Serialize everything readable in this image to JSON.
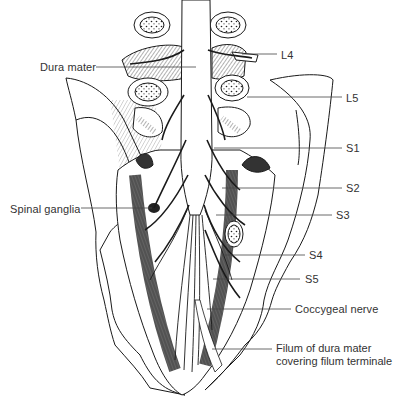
{
  "figure": {
    "line_color": "#1a1a1a",
    "leader_color": "#444444",
    "text_color": "#333333",
    "background": "#ffffff"
  },
  "labels": [
    {
      "id": "dura-mater",
      "text": "Dura mater",
      "x": 40,
      "y": 61,
      "line": [
        96,
        67,
        196,
        67
      ]
    },
    {
      "id": "l4",
      "text": "L4",
      "x": 281,
      "y": 49,
      "line": [
        242,
        54,
        277,
        54
      ]
    },
    {
      "id": "l5",
      "text": "L5",
      "x": 346,
      "y": 92,
      "line": [
        247,
        97,
        342,
        97
      ]
    },
    {
      "id": "s1",
      "text": "S1",
      "x": 346,
      "y": 142,
      "line": [
        214,
        148,
        342,
        148
      ]
    },
    {
      "id": "s2",
      "text": "S2",
      "x": 346,
      "y": 182,
      "line": [
        222,
        188,
        342,
        188
      ]
    },
    {
      "id": "spinal-ganglia",
      "text": "Spinal ganglia",
      "x": 10,
      "y": 203,
      "line": [
        81,
        208,
        152,
        208
      ]
    },
    {
      "id": "s3",
      "text": "S3",
      "x": 336,
      "y": 209,
      "line": [
        216,
        215,
        332,
        215
      ]
    },
    {
      "id": "s4",
      "text": "S4",
      "x": 309,
      "y": 249,
      "line": [
        222,
        255,
        305,
        255
      ]
    },
    {
      "id": "s5",
      "text": "S5",
      "x": 305,
      "y": 273,
      "line": [
        213,
        279,
        300,
        279
      ]
    },
    {
      "id": "coccygeal-nerve",
      "text": "Coccygeal nerve",
      "x": 295,
      "y": 303,
      "line": [
        207,
        309,
        291,
        309
      ]
    },
    {
      "id": "filum",
      "text": "Filum of dura mater",
      "text2": "covering filum terminale",
      "x": 276,
      "y": 342,
      "line": [
        212,
        349,
        272,
        349
      ]
    }
  ]
}
